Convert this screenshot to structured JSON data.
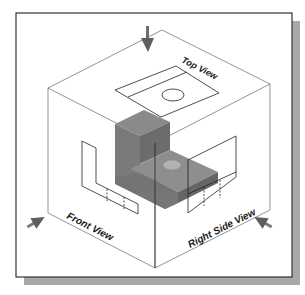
{
  "diagram": {
    "labels": {
      "top_view": "Top View",
      "front_view": "Front View",
      "right_side_view": "Right Side View"
    },
    "colors": {
      "background": "#ffffff",
      "frame_border": "#333333",
      "frame_shadow": "#a8a8a8",
      "box_edge": "#555555",
      "projection_line": "#222222",
      "object_front": "#7a7a7a",
      "object_top": "#8e8e8e",
      "object_side": "#6a6a6a",
      "hole": "#b0b0b0",
      "arrow": "#6e6e6e"
    },
    "elements": {
      "viewing_arrows": [
        "top-view-arrow",
        "front-view-arrow",
        "right-side-view-arrow"
      ],
      "projection_planes": [
        "top-plane",
        "front-plane",
        "right-side-plane"
      ],
      "object": "L-bracket with hole"
    }
  }
}
